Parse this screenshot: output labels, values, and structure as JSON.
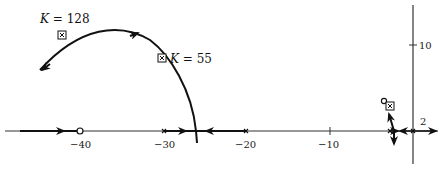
{
  "diagram": {
    "type": "root-locus",
    "axes": {
      "real_ticks": [
        {
          "value": -40,
          "label": "−40"
        },
        {
          "value": -30,
          "label": "−30"
        },
        {
          "value": -20,
          "label": "−20"
        },
        {
          "value": -10,
          "label": "−10"
        },
        {
          "value": 2,
          "label": "2"
        }
      ],
      "imag_ticks": [
        {
          "value": 10,
          "label": "10"
        }
      ]
    },
    "annotations": {
      "k128": {
        "var": "K",
        "text": " = 128"
      },
      "k55": {
        "var": "K",
        "text": " = 55"
      }
    },
    "markers": {
      "zeros": [
        -40,
        -3.2
      ],
      "poles": [
        -30,
        -20,
        -3,
        -1,
        0
      ],
      "closed_loop_points": [
        "K = 128",
        "K = 55",
        "near origin"
      ]
    },
    "colors": {
      "line": "#111111",
      "axis": "#333333"
    }
  }
}
